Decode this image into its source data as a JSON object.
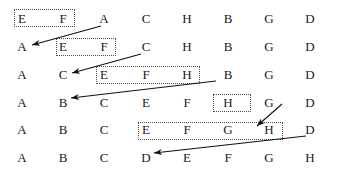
{
  "figure": {
    "type": "insertion-sort-trace",
    "columns": 8,
    "rows": 6,
    "col_x": [
      22,
      63,
      104,
      146,
      187,
      228,
      269,
      310
    ],
    "row_y": [
      22,
      50,
      78,
      106,
      133,
      161
    ],
    "colors": {
      "text": "#1a1a1a",
      "box_border": "#4d4d4d",
      "arrow": "#111111",
      "background": "#ffffff"
    },
    "rows_data": [
      {
        "index": 0,
        "letters": [
          "E",
          "F",
          "A",
          "C",
          "H",
          "B",
          "G",
          "D"
        ]
      },
      {
        "index": 1,
        "letters": [
          "A",
          "E",
          "F",
          "C",
          "H",
          "B",
          "G",
          "D"
        ]
      },
      {
        "index": 2,
        "letters": [
          "A",
          "C",
          "E",
          "F",
          "H",
          "B",
          "G",
          "D"
        ]
      },
      {
        "index": 3,
        "letters": [
          "A",
          "B",
          "C",
          "E",
          "F",
          "H",
          "G",
          "D"
        ]
      },
      {
        "index": 4,
        "letters": [
          "A",
          "B",
          "C",
          "E",
          "F",
          "G",
          "H",
          "D"
        ]
      },
      {
        "index": 5,
        "letters": [
          "A",
          "B",
          "C",
          "D",
          "E",
          "F",
          "G",
          "H"
        ]
      }
    ],
    "highlight_boxes": [
      {
        "id": "box-row1-ef",
        "row": 0,
        "letters": [
          "E",
          "F"
        ],
        "x": 14,
        "y": 9,
        "w": 61,
        "h": 18
      },
      {
        "id": "box-row2-ef",
        "row": 1,
        "letters": [
          "E",
          "F"
        ],
        "x": 56,
        "y": 38,
        "w": 60,
        "h": 18
      },
      {
        "id": "box-row3-efh",
        "row": 2,
        "letters": [
          "E",
          "F",
          "H"
        ],
        "x": 96,
        "y": 66,
        "w": 104,
        "h": 18
      },
      {
        "id": "box-row4-h",
        "row": 3,
        "letters": [
          "H"
        ],
        "x": 213,
        "y": 94,
        "w": 38,
        "h": 18
      },
      {
        "id": "box-row5-efgh",
        "row": 4,
        "letters": [
          "E",
          "F",
          "G",
          "H"
        ],
        "x": 138,
        "y": 122,
        "w": 145,
        "h": 18
      }
    ],
    "arrows": [
      {
        "id": "arrow-a-to-front",
        "from_letter": "A",
        "to_row": 1,
        "x1": 101,
        "y1": 26,
        "x2": 32,
        "y2": 45
      },
      {
        "id": "arrow-c-to-front",
        "from_letter": "C",
        "to_row": 2,
        "x1": 141,
        "y1": 54,
        "x2": 72,
        "y2": 73
      },
      {
        "id": "arrow-b-to-front",
        "from_letter": "B",
        "to_row": 3,
        "x1": 216,
        "y1": 81,
        "x2": 71,
        "y2": 98
      },
      {
        "id": "arrow-g-insert",
        "from_letter": "G",
        "to_row": 4,
        "x1": 282,
        "y1": 104,
        "x2": 257,
        "y2": 126
      },
      {
        "id": "arrow-d-to-front",
        "from_letter": "D",
        "to_row": 5,
        "x1": 306,
        "y1": 136,
        "x2": 154,
        "y2": 153
      }
    ]
  }
}
